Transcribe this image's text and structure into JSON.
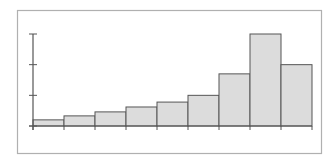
{
  "chart_data": {
    "type": "bar",
    "title": "",
    "xlabel": "",
    "ylabel": "",
    "categories": [
      "1",
      "2",
      "3",
      "4",
      "5",
      "6",
      "7",
      "8",
      "9"
    ],
    "values": [
      0.2,
      0.33,
      0.46,
      0.62,
      0.78,
      1.0,
      1.7,
      3.0,
      2.0
    ],
    "ylim": [
      0,
      3
    ],
    "yticks": [
      0,
      1,
      2,
      3
    ],
    "show_tick_labels": false,
    "grid": false,
    "legend": null,
    "bar_style": "histogram-contiguous"
  },
  "colors": {
    "frame": "#b0b0b0",
    "axis": "#555555",
    "bar_fill": "#dcdcdc",
    "bar_stroke": "#555555",
    "background": "#ffffff"
  },
  "layout": {
    "frame": {
      "x": 17,
      "y": 10,
      "w": 304,
      "h": 143
    },
    "plot": {
      "x0": 33,
      "y0": 126,
      "x1": 312,
      "ytop": 34
    }
  }
}
